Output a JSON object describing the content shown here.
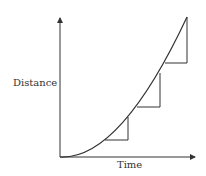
{
  "diagram": {
    "type": "distance-time curve with gradient triangles",
    "axes": {
      "x_label": "Time",
      "y_label": "Distance"
    },
    "curve": {
      "description": "increasing, concave-up curve (acceleration)",
      "color": "#333333"
    },
    "gradient_triangles": [
      {
        "name": "triangle-1",
        "position": "lower"
      },
      {
        "name": "triangle-2",
        "position": "middle"
      },
      {
        "name": "triangle-3",
        "position": "upper"
      }
    ],
    "colors": {
      "stroke": "#333333",
      "background": "#ffffff"
    }
  }
}
